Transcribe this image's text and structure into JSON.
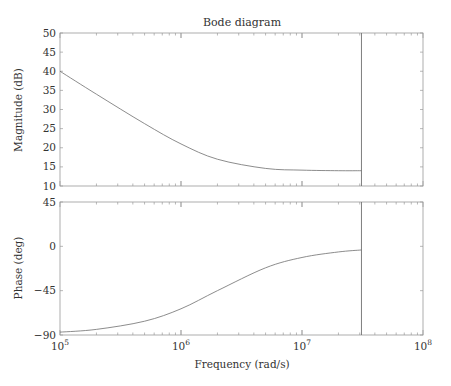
{
  "chart_data": [
    {
      "type": "line",
      "title": "Bode diagram",
      "panel": "magnitude",
      "xlabel": "Frequency (rad/s)",
      "ylabel": "Magnitude (dB)",
      "xscale": "log",
      "xlim": [
        100000,
        100000000
      ],
      "ylim": [
        10,
        50
      ],
      "yticks": [
        10,
        15,
        20,
        25,
        30,
        35,
        40,
        45,
        50
      ],
      "ytick_labels": [
        "10",
        "15",
        "20",
        "25",
        "30",
        "35",
        "40",
        "45",
        "50"
      ],
      "grid": false,
      "series": [
        {
          "name": "Magnitude",
          "x": [
            100000,
            200000,
            500000,
            1000000,
            2000000,
            5000000,
            10000000,
            20000000,
            31000000
          ],
          "y": [
            40.0,
            34.0,
            26.3,
            21.0,
            17.0,
            14.6,
            14.15,
            14.0,
            14.0
          ]
        }
      ],
      "vertical_marker_x": 31000000
    },
    {
      "type": "line",
      "panel": "phase",
      "xlabel": "Frequency (rad/s)",
      "ylabel": "Phase (deg)",
      "xscale": "log",
      "xlim": [
        100000,
        100000000
      ],
      "ylim": [
        -90,
        45
      ],
      "yticks": [
        -90,
        -45,
        0,
        45
      ],
      "ytick_labels": [
        "-90",
        "-45",
        "0",
        "45"
      ],
      "xticks": [
        100000,
        1000000,
        10000000,
        100000000
      ],
      "xtick_labels": [
        {
          "base": "10",
          "exp": "5"
        },
        {
          "base": "10",
          "exp": "6"
        },
        {
          "base": "10",
          "exp": "7"
        },
        {
          "base": "10",
          "exp": "8"
        }
      ],
      "grid": false,
      "series": [
        {
          "name": "Phase",
          "x": [
            100000,
            200000,
            500000,
            1000000,
            2000000,
            5000000,
            10000000,
            20000000,
            31000000
          ],
          "y": [
            -87.1,
            -84.3,
            -76.0,
            -63.4,
            -45.0,
            -21.8,
            -11.3,
            -5.7,
            -3.7
          ]
        }
      ],
      "vertical_marker_x": 31000000
    }
  ]
}
